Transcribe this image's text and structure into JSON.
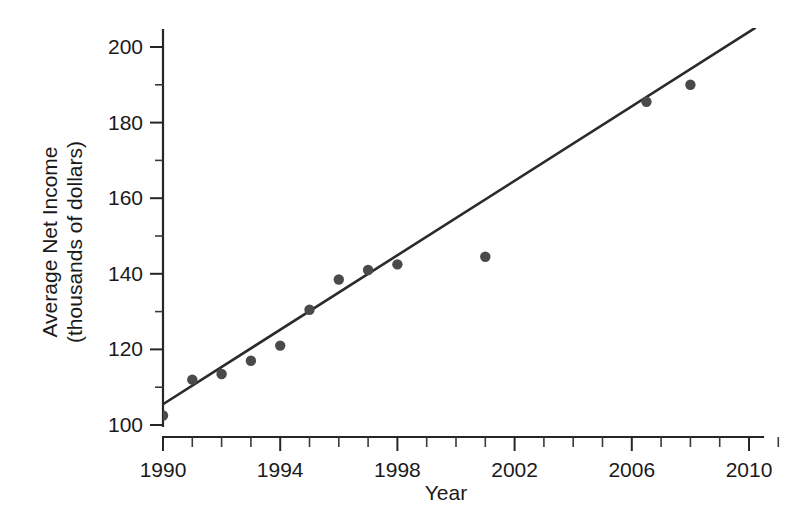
{
  "chart_data": {
    "type": "scatter",
    "title": "",
    "xlabel": "Year",
    "ylabel": "Average Net Income\n(thousands of dollars)",
    "ylabel_line1": "Average Net Income",
    "ylabel_line2": "(thousands of dollars)",
    "xlim": [
      1990,
      2011.2
    ],
    "ylim": [
      100,
      201.5
    ],
    "x_ticks_major": [
      1990,
      1994,
      1998,
      2002,
      2006,
      2010
    ],
    "x_tick_labels": [
      "1990",
      "1994",
      "1998",
      "2002",
      "2006",
      "2010"
    ],
    "x_ticks_minor": [
      1991,
      1992,
      1993,
      1995,
      1996,
      1997,
      1999,
      2000,
      2001,
      2003,
      2004,
      2005,
      2007,
      2008,
      2009,
      2011
    ],
    "y_ticks_major": [
      100,
      120,
      140,
      160,
      180,
      200
    ],
    "y_tick_labels": [
      "100",
      "120",
      "140",
      "160",
      "180",
      "200"
    ],
    "y_ticks_minor": [
      110,
      130,
      150,
      170,
      190
    ],
    "grid": false,
    "legend": null,
    "marker_color": "#4a4a4a",
    "line_color": "#2b2b2b",
    "axis_color": "#262626",
    "series": [
      {
        "name": "Average Net Income",
        "type": "scatter",
        "x": [
          1990,
          1991,
          1992,
          1993,
          1994,
          1995,
          1996,
          1997,
          1998,
          2001,
          2006.5,
          2008
        ],
        "y": [
          102.5,
          112,
          113.5,
          117,
          121,
          130.5,
          138.5,
          141,
          142.5,
          144.5,
          185.5,
          190
        ],
        "points": [
          {
            "x": 1990,
            "y": 102.5
          },
          {
            "x": 1991,
            "y": 112.0
          },
          {
            "x": 1992,
            "y": 113.5
          },
          {
            "x": 1993,
            "y": 117.0
          },
          {
            "x": 1994,
            "y": 121.0
          },
          {
            "x": 1995,
            "y": 130.5
          },
          {
            "x": 1996,
            "y": 138.5
          },
          {
            "x": 1997,
            "y": 141.0
          },
          {
            "x": 1998,
            "y": 142.5
          },
          {
            "x": 2001,
            "y": 144.5
          },
          {
            "x": 2006.5,
            "y": 185.5
          },
          {
            "x": 2008,
            "y": 190.0
          }
        ]
      },
      {
        "name": "Trend line",
        "type": "line",
        "x": [
          1990,
          2010.2
        ],
        "y": [
          105.5,
          205.0
        ]
      }
    ]
  }
}
